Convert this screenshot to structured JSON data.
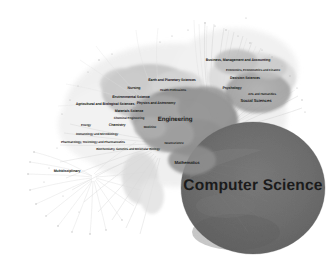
{
  "figure": {
    "name": "science-map-network",
    "type": "network-map",
    "background_color": "#ffffff",
    "palette": {
      "background": "#ffffff",
      "label_color": "#1b1b1b",
      "cluster_dark": "#6e6e6e",
      "cluster_mid": "#9a9a9a",
      "cluster_light": "#c9c9c9",
      "cluster_pale": "#e2e2e2",
      "edge_color": "#c4c4c4",
      "node_dot": "#b5b5b5"
    }
  },
  "chart_data": {
    "type": "scatter",
    "title": "",
    "xlabel": "",
    "ylabel": "",
    "grid": false,
    "legend": "none",
    "nodes": [
      {
        "label": "Computer Science",
        "x": 253,
        "y": 186,
        "size": "xl",
        "weight": 100,
        "cluster": 1
      },
      {
        "label": "Mathematics",
        "x": 187,
        "y": 163,
        "size": "m",
        "weight": 38,
        "cluster": 1
      },
      {
        "label": "Engineering",
        "x": 175,
        "y": 120,
        "size": "l",
        "weight": 62,
        "cluster": 2
      },
      {
        "label": "Materials Science",
        "x": 129,
        "y": 112,
        "size": "s",
        "weight": 30,
        "cluster": 2
      },
      {
        "label": "Chemical Engineering",
        "x": 129,
        "y": 119,
        "size": "xs",
        "weight": 20,
        "cluster": 2
      },
      {
        "label": "Chemistry",
        "x": 117,
        "y": 126,
        "size": "s",
        "weight": 24,
        "cluster": 2
      },
      {
        "label": "Energy",
        "x": 86,
        "y": 126,
        "size": "xs",
        "weight": 15,
        "cluster": 2
      },
      {
        "label": "Physics and Astronomy",
        "x": 156,
        "y": 104,
        "size": "s",
        "weight": 28,
        "cluster": 2
      },
      {
        "label": "Agricultural and Biological Sciences",
        "x": 105,
        "y": 105,
        "size": "s",
        "weight": 26,
        "cluster": 3
      },
      {
        "label": "Environmental Science",
        "x": 131,
        "y": 98,
        "size": "s",
        "weight": 25,
        "cluster": 3
      },
      {
        "label": "Earth and Planetary Sciences",
        "x": 172,
        "y": 81,
        "size": "s",
        "weight": 22,
        "cluster": 3
      },
      {
        "label": "Nursing",
        "x": 134,
        "y": 89,
        "size": "s",
        "weight": 18,
        "cluster": 4
      },
      {
        "label": "Health Professions",
        "x": 173,
        "y": 91,
        "size": "xs",
        "weight": 16,
        "cluster": 4
      },
      {
        "label": "Medicine",
        "x": 150,
        "y": 128,
        "size": "xs",
        "weight": 34,
        "cluster": 4
      },
      {
        "label": "Neuroscience",
        "x": 174,
        "y": 144,
        "size": "xs",
        "weight": 17,
        "cluster": 4
      },
      {
        "label": "Biochemistry, Genetics and Molecular Biology",
        "x": 128,
        "y": 150,
        "size": "xs",
        "weight": 27,
        "cluster": 3
      },
      {
        "label": "Immunology and Microbiology",
        "x": 97,
        "y": 135,
        "size": "xs",
        "weight": 14,
        "cluster": 3
      },
      {
        "label": "Pharmacology, Toxicology and Pharmaceutics",
        "x": 93,
        "y": 143,
        "size": "xs",
        "weight": 15,
        "cluster": 3
      },
      {
        "label": "Multidisciplinary",
        "x": 67,
        "y": 172,
        "size": "s",
        "weight": 19,
        "cluster": 5
      },
      {
        "label": "Business, Management and Accounting",
        "x": 238,
        "y": 61,
        "size": "s",
        "weight": 23,
        "cluster": 6
      },
      {
        "label": "Economics, Econometrics and Finance",
        "x": 253,
        "y": 71,
        "size": "xs",
        "weight": 18,
        "cluster": 6
      },
      {
        "label": "Decision Sciences",
        "x": 245,
        "y": 79,
        "size": "s",
        "weight": 20,
        "cluster": 6
      },
      {
        "label": "Psychology",
        "x": 232,
        "y": 89,
        "size": "s",
        "weight": 19,
        "cluster": 6
      },
      {
        "label": "Arts and Humanities",
        "x": 262,
        "y": 95,
        "size": "xs",
        "weight": 17,
        "cluster": 6
      },
      {
        "label": "Social Sciences",
        "x": 256,
        "y": 101,
        "size": "m",
        "weight": 36,
        "cluster": 6
      }
    ],
    "clusters": [
      {
        "id": 1,
        "name": "Computer Science",
        "shade": "#6e6e6e"
      },
      {
        "id": 2,
        "name": "Engineering and Physical Sciences",
        "shade": "#8e8e8e"
      },
      {
        "id": 3,
        "name": "Life and Environmental Sciences",
        "shade": "#bdbdbd"
      },
      {
        "id": 4,
        "name": "Health Sciences",
        "shade": "#a8a8a8"
      },
      {
        "id": 5,
        "name": "Multidisciplinary",
        "shade": "#dcdcdc"
      },
      {
        "id": 6,
        "name": "Social Sciences",
        "shade": "#9c9c9c"
      }
    ]
  }
}
